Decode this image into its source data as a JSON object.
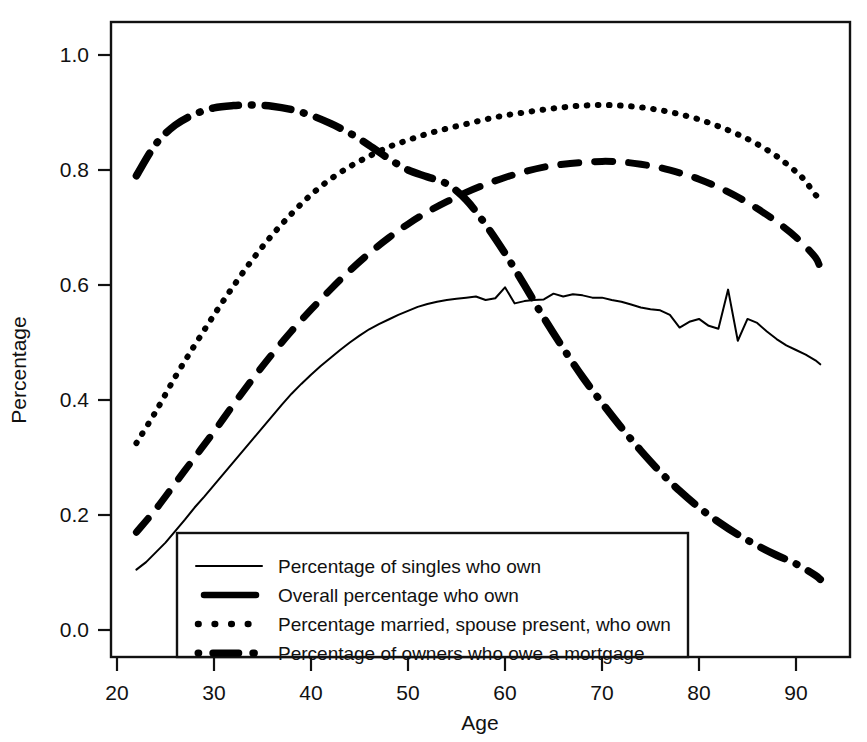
{
  "chart_data": {
    "type": "line",
    "title": "",
    "xlabel": "Age",
    "ylabel": "Percentage",
    "xlim": [
      20,
      95
    ],
    "ylim": [
      0.0,
      1.0
    ],
    "grid": false,
    "legend_position": "bottom-left-inside",
    "xticks": [
      20,
      30,
      40,
      50,
      60,
      70,
      80,
      90
    ],
    "xtick_labels": [
      "20",
      "30",
      "40",
      "50",
      "60",
      "70",
      "80",
      "90"
    ],
    "yticks": [
      0.0,
      0.2,
      0.4,
      0.6,
      0.8,
      1.0
    ],
    "ytick_labels": [
      "0.0",
      "0.2",
      "0.4",
      "0.6",
      "0.8",
      "1.0"
    ],
    "series": [
      {
        "name": "Percentage of singles who own",
        "style": "solid",
        "x": [
          22,
          23,
          24,
          25,
          26,
          27,
          28,
          29,
          30,
          31,
          32,
          33,
          34,
          35,
          36,
          37,
          38,
          39,
          40,
          41,
          42,
          43,
          44,
          45,
          46,
          47,
          48,
          49,
          50,
          51,
          52,
          53,
          54,
          55,
          56,
          57,
          58,
          59,
          60,
          61,
          62,
          63,
          64,
          65,
          66,
          67,
          68,
          69,
          70,
          71,
          72,
          73,
          74,
          75,
          76,
          77,
          78,
          79,
          80,
          81,
          82,
          83,
          84,
          85,
          86,
          87,
          88,
          89,
          90,
          91,
          92,
          92.5
        ],
        "y": [
          0.105,
          0.118,
          0.135,
          0.152,
          0.172,
          0.192,
          0.213,
          0.232,
          0.252,
          0.272,
          0.292,
          0.312,
          0.332,
          0.352,
          0.372,
          0.392,
          0.411,
          0.428,
          0.444,
          0.459,
          0.473,
          0.487,
          0.5,
          0.512,
          0.523,
          0.532,
          0.54,
          0.548,
          0.555,
          0.562,
          0.567,
          0.571,
          0.574,
          0.576,
          0.578,
          0.58,
          0.574,
          0.577,
          0.596,
          0.568,
          0.572,
          0.574,
          0.575,
          0.585,
          0.58,
          0.584,
          0.582,
          0.578,
          0.578,
          0.574,
          0.571,
          0.566,
          0.561,
          0.558,
          0.556,
          0.548,
          0.526,
          0.536,
          0.541,
          0.529,
          0.524,
          0.592,
          0.503,
          0.541,
          0.534,
          0.519,
          0.506,
          0.495,
          0.487,
          0.479,
          0.469,
          0.462
        ]
      },
      {
        "name": "Overall percentage who own",
        "style": "dashed",
        "x": [
          22,
          24,
          26,
          28,
          30,
          32,
          34,
          36,
          38,
          40,
          42,
          44,
          46,
          48,
          50,
          52,
          54,
          56,
          58,
          60,
          62,
          64,
          66,
          68,
          70,
          72,
          74,
          76,
          78,
          80,
          82,
          84,
          86,
          88,
          90,
          92,
          92.5
        ],
        "y": [
          0.17,
          0.21,
          0.255,
          0.3,
          0.345,
          0.392,
          0.437,
          0.48,
          0.52,
          0.557,
          0.592,
          0.625,
          0.655,
          0.682,
          0.706,
          0.727,
          0.745,
          0.761,
          0.775,
          0.787,
          0.797,
          0.805,
          0.81,
          0.813,
          0.815,
          0.814,
          0.81,
          0.804,
          0.795,
          0.784,
          0.77,
          0.753,
          0.733,
          0.71,
          0.683,
          0.648,
          0.628
        ]
      },
      {
        "name": "Percentage married, spouse present, who own",
        "style": "dotted",
        "x": [
          22,
          24,
          26,
          28,
          30,
          32,
          34,
          36,
          38,
          40,
          42,
          44,
          46,
          48,
          50,
          52,
          54,
          56,
          58,
          60,
          62,
          64,
          66,
          68,
          70,
          72,
          74,
          76,
          78,
          80,
          82,
          84,
          86,
          88,
          90,
          91,
          92,
          92.5
        ],
        "y": [
          0.325,
          0.38,
          0.44,
          0.495,
          0.548,
          0.598,
          0.645,
          0.687,
          0.724,
          0.757,
          0.784,
          0.806,
          0.824,
          0.84,
          0.852,
          0.863,
          0.872,
          0.88,
          0.888,
          0.895,
          0.9,
          0.905,
          0.909,
          0.912,
          0.913,
          0.912,
          0.909,
          0.904,
          0.897,
          0.888,
          0.876,
          0.862,
          0.845,
          0.824,
          0.797,
          0.78,
          0.757,
          0.752
        ]
      },
      {
        "name": "Percentage of owners who owe a mortgage",
        "style": "dashdot",
        "x": [
          22,
          24,
          26,
          28,
          30,
          32,
          34,
          36,
          38,
          40,
          42,
          44,
          46,
          48,
          50,
          52,
          54,
          56,
          58,
          60,
          62,
          64,
          66,
          68,
          70,
          72,
          74,
          76,
          78,
          80,
          82,
          84,
          86,
          88,
          90,
          92,
          92.5
        ],
        "y": [
          0.79,
          0.845,
          0.878,
          0.897,
          0.908,
          0.912,
          0.913,
          0.911,
          0.905,
          0.895,
          0.881,
          0.864,
          0.843,
          0.82,
          0.8,
          0.788,
          0.776,
          0.748,
          0.705,
          0.655,
          0.6,
          0.543,
          0.49,
          0.44,
          0.395,
          0.352,
          0.312,
          0.275,
          0.242,
          0.213,
          0.188,
          0.166,
          0.147,
          0.13,
          0.115,
          0.095,
          0.088
        ]
      }
    ]
  },
  "legend": {
    "entries": [
      {
        "label": "Percentage of singles who own",
        "style": "solid"
      },
      {
        "label": "Overall percentage who own",
        "style": "dashed"
      },
      {
        "label": "Percentage married, spouse present, who own",
        "style": "dotted"
      },
      {
        "label": "Percentage of owners who owe a mortgage",
        "style": "dashdot"
      }
    ]
  },
  "colors": {
    "ink": "#111111",
    "background": "#ffffff",
    "series": "#000000"
  }
}
